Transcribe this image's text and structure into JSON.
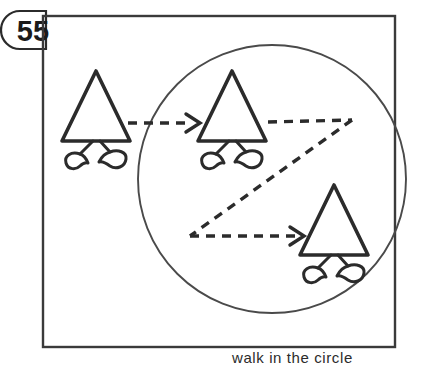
{
  "figure": {
    "number_badge": "55",
    "caption": "walk in the circle",
    "stroke_color": "#2b2b2b",
    "background_color": "#ffffff",
    "frame": {
      "name": "outer-rectangle",
      "x": 43,
      "y": 16,
      "width": 352,
      "height": 331
    },
    "circle": {
      "name": "region-circle",
      "cx": 272,
      "cy": 179,
      "r": 134
    },
    "characters": [
      {
        "id": "triangle-person-start",
        "label": "triangle person outside circle",
        "cx": 96,
        "cy": 118,
        "half_width": 34,
        "height": 47,
        "inside_circle": false
      },
      {
        "id": "triangle-person-entering",
        "label": "triangle person at circle entry",
        "cx": 232,
        "cy": 118,
        "half_width": 34,
        "height": 47,
        "inside_circle": true
      },
      {
        "id": "triangle-person-end",
        "label": "triangle person at path end",
        "cx": 334,
        "cy": 232,
        "half_width": 34,
        "height": 47,
        "inside_circle": true
      }
    ],
    "arrows": [
      {
        "id": "arrow-enter-circle",
        "label": "dashed arrow into circle",
        "points": "128,123 196,123",
        "arrowhead": true
      },
      {
        "id": "zigzag-path",
        "label": "dashed zigzag walking path",
        "points": "266,122 352,120 190,236",
        "arrowhead": false
      },
      {
        "id": "arrow-to-end-figure",
        "label": "dashed arrow to final figure",
        "points": "190,236 300,236",
        "arrowhead": true
      }
    ]
  }
}
